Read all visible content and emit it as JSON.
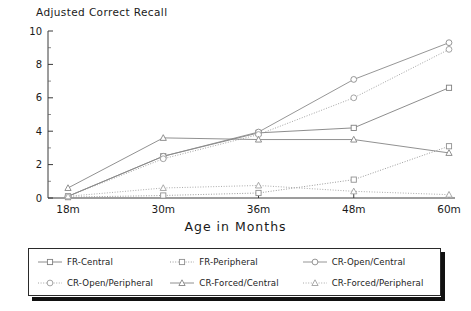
{
  "chart_data": {
    "type": "line",
    "title": "",
    "ylabel": "Adjusted Correct Recall",
    "xlabel": "Age in Months",
    "categories": [
      "18m",
      "30m",
      "36m",
      "48m",
      "60m"
    ],
    "xticklabels": [
      "18m",
      "30m",
      "36m",
      "48m",
      "60m"
    ],
    "yticklabels": [
      "0",
      "2",
      "4",
      "6",
      "8",
      "10"
    ],
    "yticks": [
      0,
      2,
      4,
      6,
      8,
      10
    ],
    "ylim": [
      0,
      10
    ],
    "grid": false,
    "legend_position": "below-axes",
    "series": [
      {
        "name": "FR-Central",
        "marker": "square",
        "linestyle": "solid",
        "color": "#808080",
        "values": [
          0.1,
          2.5,
          3.9,
          4.2,
          6.6
        ]
      },
      {
        "name": "FR-Peripheral",
        "marker": "square",
        "linestyle": "dotted",
        "color": "#909090",
        "values": [
          0.05,
          0.15,
          0.3,
          1.1,
          3.1
        ]
      },
      {
        "name": "CR-Open/Central",
        "marker": "circle",
        "linestyle": "solid",
        "color": "#8a8a8a",
        "values": [
          0.1,
          2.5,
          3.95,
          7.1,
          9.3
        ]
      },
      {
        "name": "CR-Open/Peripheral",
        "marker": "circle",
        "linestyle": "dotted",
        "color": "#9a9a9a",
        "values": [
          0.1,
          2.35,
          3.8,
          6.0,
          8.9
        ]
      },
      {
        "name": "CR-Forced/Central",
        "marker": "triangle",
        "linestyle": "solid",
        "color": "#858585",
        "values": [
          0.6,
          3.6,
          3.5,
          3.5,
          2.7
        ]
      },
      {
        "name": "CR-Forced/Peripheral",
        "marker": "triangle",
        "linestyle": "dotted",
        "color": "#a0a0a0",
        "values": [
          0.1,
          0.6,
          0.75,
          0.4,
          0.2
        ]
      }
    ]
  },
  "legend": {
    "entries": [
      {
        "label": "FR-Central"
      },
      {
        "label": "FR-Peripheral"
      },
      {
        "label": "CR-Open/Central"
      },
      {
        "label": "CR-Open/Peripheral"
      },
      {
        "label": "CR-Forced/Central"
      },
      {
        "label": "CR-Forced/Peripheral"
      }
    ]
  }
}
